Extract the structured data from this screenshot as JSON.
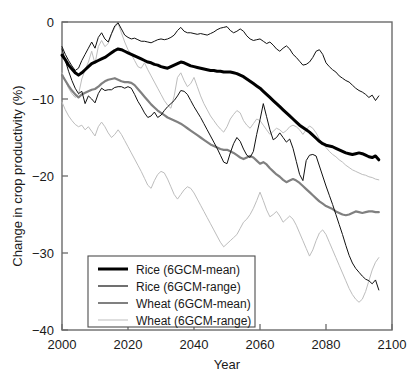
{
  "chart_data": {
    "type": "line",
    "title": "",
    "xlabel": "Year",
    "ylabel": "Change in crop productivity (%)",
    "xlim": [
      2000,
      2100
    ],
    "ylim": [
      -40,
      0
    ],
    "grid": false,
    "legend_position": "lower left",
    "xticks": [
      2000,
      2020,
      2040,
      2060,
      2080,
      2100
    ],
    "xtick_labels": [
      "2000",
      "2020",
      "2040",
      "2060",
      "2080",
      "2100"
    ],
    "yticks": [
      0,
      -10,
      -20,
      -30,
      -40
    ],
    "ytick_labels": [
      "0",
      "−10",
      "−20",
      "−30",
      "−40"
    ],
    "x": [
      2000,
      2001,
      2002,
      2003,
      2004,
      2005,
      2006,
      2007,
      2008,
      2009,
      2010,
      2011,
      2012,
      2013,
      2014,
      2015,
      2016,
      2017,
      2018,
      2019,
      2020,
      2021,
      2022,
      2023,
      2024,
      2025,
      2026,
      2027,
      2028,
      2029,
      2030,
      2031,
      2032,
      2033,
      2034,
      2035,
      2036,
      2037,
      2038,
      2039,
      2040,
      2041,
      2042,
      2043,
      2044,
      2045,
      2046,
      2047,
      2048,
      2049,
      2050,
      2051,
      2052,
      2053,
      2054,
      2055,
      2056,
      2057,
      2058,
      2059,
      2060,
      2061,
      2062,
      2063,
      2064,
      2065,
      2066,
      2067,
      2068,
      2069,
      2070,
      2071,
      2072,
      2073,
      2074,
      2075,
      2076,
      2077,
      2078,
      2079,
      2080,
      2081,
      2082,
      2083,
      2084,
      2085,
      2086,
      2087,
      2088,
      2089,
      2090,
      2091,
      2092,
      2093,
      2094,
      2095,
      2096
    ],
    "series": [
      {
        "name": "Rice (6GCM-mean)",
        "color": "#000000",
        "width": 3.0,
        "values": [
          -4.3,
          -4.9,
          -5.6,
          -6.1,
          -6.6,
          -6.9,
          -6.6,
          -6.2,
          -5.8,
          -5.4,
          -5.2,
          -5.0,
          -4.8,
          -4.6,
          -4.3,
          -4.0,
          -3.7,
          -3.5,
          -3.6,
          -3.8,
          -4.0,
          -4.2,
          -4.4,
          -4.6,
          -4.8,
          -5.0,
          -5.2,
          -5.3,
          -5.5,
          -5.6,
          -5.8,
          -5.9,
          -6.0,
          -5.8,
          -5.6,
          -5.4,
          -5.2,
          -5.3,
          -5.5,
          -5.7,
          -5.8,
          -5.9,
          -6.0,
          -6.1,
          -6.2,
          -6.3,
          -6.3,
          -6.4,
          -6.4,
          -6.5,
          -6.5,
          -6.5,
          -6.6,
          -6.7,
          -6.9,
          -7.1,
          -7.4,
          -7.7,
          -8.0,
          -8.3,
          -8.6,
          -9.0,
          -9.4,
          -9.8,
          -10.2,
          -10.6,
          -11.0,
          -11.4,
          -11.8,
          -12.2,
          -12.6,
          -13.0,
          -13.4,
          -13.7,
          -14.0,
          -14.3,
          -14.7,
          -15.1,
          -15.5,
          -15.8,
          -16.0,
          -16.1,
          -16.2,
          -16.4,
          -16.6,
          -16.8,
          -17.0,
          -17.1,
          -17.2,
          -17.1,
          -17.0,
          -17.1,
          -17.3,
          -17.5,
          -17.6,
          -17.4,
          -17.9
        ]
      },
      {
        "name": "Rice (6GCM-range) upper",
        "color": "#111111",
        "width": 1.0,
        "values": [
          -3.2,
          -4.2,
          -5.0,
          -5.7,
          -6.3,
          -6.0,
          -5.0,
          -4.2,
          -3.4,
          -2.6,
          -3.4,
          -2.0,
          -1.4,
          -2.2,
          -2.6,
          -1.5,
          -0.5,
          -0.1,
          -0.9,
          -1.7,
          -2.0,
          -2.2,
          -2.1,
          -2.3,
          -2.5,
          -2.5,
          -2.6,
          -2.7,
          -2.5,
          -2.3,
          -2.2,
          -2.3,
          -2.2,
          -2.0,
          -1.7,
          -1.1,
          -0.7,
          -1.2,
          -1.4,
          -1.4,
          -1.5,
          -1.6,
          -1.5,
          -1.6,
          -1.7,
          -1.5,
          -1.3,
          -1.0,
          -0.8,
          -0.7,
          -0.6,
          -1.1,
          -1.4,
          -1.2,
          -0.9,
          -1.2,
          -1.8,
          -2.2,
          -2.4,
          -2.3,
          -2.2,
          -2.5,
          -2.8,
          -2.6,
          -3.0,
          -3.5,
          -3.8,
          -3.4,
          -3.1,
          -3.5,
          -4.2,
          -4.6,
          -5.1,
          -5.6,
          -5.5,
          -5.2,
          -4.6,
          -3.8,
          -3.6,
          -4.2,
          -5.3,
          -5.8,
          -6.2,
          -6.5,
          -7.0,
          -7.3,
          -7.6,
          -7.8,
          -8.2,
          -8.6,
          -8.9,
          -9.1,
          -9.4,
          -9.8,
          -9.5,
          -10.2,
          -9.6
        ]
      },
      {
        "name": "Rice (6GCM-range) lower",
        "color": "#111111",
        "width": 1.0,
        "values": [
          -3.5,
          -5.0,
          -6.4,
          -7.6,
          -8.6,
          -9.3,
          -9.0,
          -10.6,
          -9.6,
          -10.0,
          -10.5,
          -9.3,
          -8.6,
          -8.9,
          -8.8,
          -8.8,
          -8.5,
          -8.4,
          -8.4,
          -8.6,
          -8.4,
          -8.6,
          -9.4,
          -10.3,
          -11.0,
          -11.8,
          -12.4,
          -12.2,
          -11.7,
          -12.4,
          -12.1,
          -11.5,
          -11.0,
          -10.6,
          -10.2,
          -9.6,
          -8.9,
          -9.0,
          -9.4,
          -10.2,
          -11.0,
          -11.7,
          -12.4,
          -13.2,
          -14.0,
          -14.8,
          -15.6,
          -16.4,
          -17.3,
          -18.2,
          -18.4,
          -17.0,
          -15.8,
          -15.0,
          -15.5,
          -16.5,
          -17.3,
          -17.6,
          -16.8,
          -14.6,
          -12.7,
          -10.6,
          -12.3,
          -14.0,
          -15.3,
          -15.0,
          -14.4,
          -15.0,
          -15.6,
          -15.2,
          -16.4,
          -18.1,
          -19.8,
          -20.6,
          -18.0,
          -17.3,
          -17.2,
          -17.4,
          -18.7,
          -20.0,
          -21.3,
          -22.5,
          -23.7,
          -25.0,
          -26.3,
          -27.6,
          -29.0,
          -30.3,
          -31.3,
          -32.0,
          -32.5,
          -33.0,
          -33.4,
          -33.6,
          -34.0,
          -33.5,
          -34.8
        ]
      },
      {
        "name": "Wheat (6GCM-mean)",
        "color": "#808080",
        "width": 2.2,
        "values": [
          -6.9,
          -7.6,
          -8.3,
          -8.9,
          -9.4,
          -9.8,
          -9.4,
          -9.2,
          -9.0,
          -8.8,
          -8.7,
          -8.4,
          -8.0,
          -7.7,
          -7.5,
          -7.4,
          -7.3,
          -7.5,
          -7.7,
          -7.8,
          -7.8,
          -7.9,
          -8.2,
          -8.7,
          -9.2,
          -9.7,
          -10.2,
          -10.7,
          -11.1,
          -11.5,
          -11.8,
          -12.1,
          -12.4,
          -12.6,
          -12.8,
          -13.0,
          -13.2,
          -13.5,
          -13.8,
          -14.1,
          -14.4,
          -14.7,
          -15.0,
          -15.3,
          -15.6,
          -15.9,
          -16.1,
          -16.3,
          -16.5,
          -16.6,
          -16.6,
          -16.8,
          -17.0,
          -17.3,
          -17.6,
          -17.8,
          -17.6,
          -17.4,
          -17.6,
          -18.0,
          -18.4,
          -18.2,
          -18.5,
          -19.0,
          -19.4,
          -19.8,
          -20.1,
          -20.5,
          -20.8,
          -20.6,
          -20.4,
          -20.6,
          -20.9,
          -21.3,
          -21.7,
          -22.1,
          -22.5,
          -22.9,
          -23.3,
          -23.6,
          -23.9,
          -24.1,
          -24.3,
          -24.6,
          -24.8,
          -25.0,
          -25.1,
          -25.0,
          -24.8,
          -24.6,
          -24.7,
          -24.8,
          -24.7,
          -24.6,
          -24.6,
          -24.7,
          -24.7
        ]
      },
      {
        "name": "Wheat (6GCM-range) upper",
        "color": "#bdbdbd",
        "width": 1.0,
        "values": [
          -6.6,
          -7.6,
          -8.6,
          -9.3,
          -9.8,
          -9.4,
          -7.4,
          -6.2,
          -5.2,
          -3.8,
          -5.4,
          -3.2,
          -2.4,
          -3.2,
          -2.8,
          -1.6,
          -0.7,
          -0.2,
          -1.4,
          -2.6,
          -3.6,
          -4.2,
          -5.0,
          -5.8,
          -6.0,
          -5.3,
          -6.2,
          -7.0,
          -7.8,
          -8.6,
          -9.4,
          -10.2,
          -10.8,
          -11.2,
          -9.6,
          -7.2,
          -6.6,
          -7.6,
          -8.4,
          -8.0,
          -7.2,
          -8.4,
          -9.6,
          -10.6,
          -11.4,
          -12.2,
          -12.8,
          -13.4,
          -13.9,
          -14.3,
          -13.6,
          -12.6,
          -12.0,
          -11.5,
          -11.8,
          -12.8,
          -13.4,
          -13.8,
          -13.2,
          -12.6,
          -12.8,
          -13.4,
          -14.0,
          -14.6,
          -14.2,
          -13.8,
          -14.0,
          -14.4,
          -14.1,
          -13.6,
          -13.4,
          -13.6,
          -14.0,
          -14.6,
          -14.0,
          -13.5,
          -13.8,
          -14.4,
          -15.2,
          -15.8,
          -16.3,
          -16.8,
          -17.2,
          -17.5,
          -17.9,
          -18.2,
          -18.6,
          -18.9,
          -19.2,
          -19.4,
          -19.6,
          -19.8,
          -19.9,
          -20.1,
          -20.2,
          -20.4,
          -20.5
        ]
      },
      {
        "name": "Wheat (6GCM-range) lower",
        "color": "#bdbdbd",
        "width": 1.0,
        "values": [
          -10.4,
          -11.4,
          -12.2,
          -12.8,
          -13.3,
          -13.6,
          -13.4,
          -14.0,
          -13.6,
          -14.2,
          -14.8,
          -13.6,
          -13.0,
          -13.6,
          -14.4,
          -15.0,
          -14.6,
          -14.0,
          -14.6,
          -15.4,
          -16.2,
          -17.0,
          -17.8,
          -18.6,
          -19.4,
          -20.3,
          -21.2,
          -21.6,
          -20.6,
          -19.8,
          -19.4,
          -19.6,
          -20.4,
          -21.4,
          -22.4,
          -23.0,
          -22.4,
          -21.8,
          -21.4,
          -21.6,
          -22.2,
          -23.0,
          -23.8,
          -24.6,
          -25.4,
          -26.2,
          -27.0,
          -27.8,
          -28.6,
          -29.2,
          -28.8,
          -28.4,
          -28.0,
          -27.6,
          -26.8,
          -26.0,
          -25.6,
          -25.0,
          -24.2,
          -23.2,
          -22.1,
          -23.2,
          -24.4,
          -25.3,
          -25.0,
          -24.6,
          -25.2,
          -26.0,
          -25.6,
          -25.2,
          -25.6,
          -26.4,
          -27.4,
          -28.4,
          -29.4,
          -30.4,
          -29.6,
          -28.4,
          -27.4,
          -27.0,
          -27.6,
          -28.6,
          -29.6,
          -30.6,
          -31.6,
          -32.6,
          -33.6,
          -34.6,
          -35.4,
          -36.0,
          -36.4,
          -36.0,
          -35.0,
          -33.6,
          -32.2,
          -31.2,
          -30.6
        ]
      }
    ],
    "legend_entries": [
      {
        "label": "Rice (6GCM-mean)",
        "color": "#000000",
        "width": 3.0
      },
      {
        "label": "Rice (6GCM-range)",
        "color": "#111111",
        "width": 1.2
      },
      {
        "label": "Wheat (6GCM-mean)",
        "color": "#808080",
        "width": 2.0
      },
      {
        "label": "Wheat (6GCM-range)",
        "color": "#bdbdbd",
        "width": 1.0
      }
    ]
  }
}
